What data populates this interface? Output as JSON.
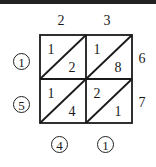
{
  "top_digits": [
    "2",
    "3"
  ],
  "right_digits": [
    "6",
    "7"
  ],
  "cells": [
    {
      "row": 0,
      "col": 0,
      "tens": "1",
      "ones": "2"
    },
    {
      "row": 0,
      "col": 1,
      "tens": "1",
      "ones": "8"
    },
    {
      "row": 1,
      "col": 0,
      "tens": "1",
      "ones": "4"
    },
    {
      "row": 1,
      "col": 1,
      "tens": "2",
      "ones": "1"
    }
  ],
  "left_result_digits": [
    "1",
    "5"
  ],
  "bottom_result_digits": [
    "4",
    "1"
  ]
}
